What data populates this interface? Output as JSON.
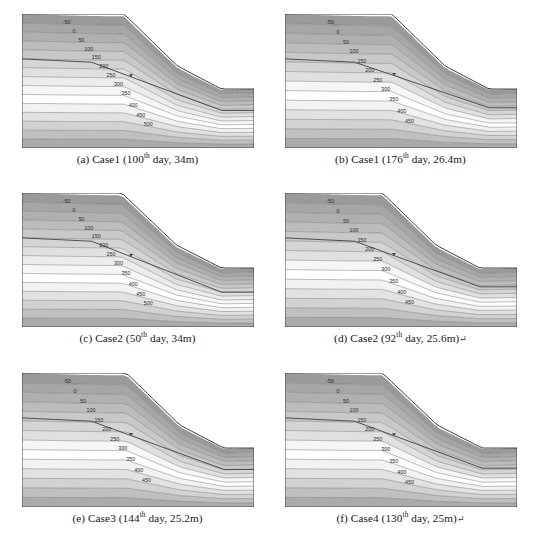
{
  "figure": {
    "title": "",
    "panel_count": 6,
    "layout": "2 columns x 3 rows",
    "background_color": "#ffffff"
  },
  "chart_data": {
    "type": "heatmap",
    "xlabel": "",
    "ylabel": "",
    "grid": false,
    "legend": "none",
    "contour_units": "kPa",
    "shading": "greyscale contour bands, dark at top and bottom, light in middle",
    "panels": [
      {
        "key": "a",
        "label": "(a)",
        "case": "Case1",
        "day": "100",
        "day_ordinal": "th",
        "depth": "34m",
        "caption_prefix": "(a) Case1 (100",
        "caption_mid": " day, 34m)",
        "caption_tail": "",
        "contour_labels": [
          -50,
          0,
          50,
          100,
          150,
          200,
          250,
          300,
          350,
          400,
          450,
          500
        ],
        "contour_min": -50,
        "contour_max": 500,
        "contour_interval": 50,
        "phreatic_marker": true,
        "crest_x_frac": 0.44,
        "toe_x_frac": 0.86,
        "water_table_end_y_frac": 0.72
      },
      {
        "key": "b",
        "label": "(b)",
        "case": "Case1",
        "day": "176",
        "day_ordinal": "th",
        "depth": "26.4m",
        "caption_prefix": "(b) Case1 (176",
        "caption_mid": " day, 26.4m)",
        "caption_tail": "",
        "contour_labels": [
          -50,
          0,
          50,
          100,
          150,
          200,
          250,
          300,
          350,
          400,
          450
        ],
        "contour_min": -50,
        "contour_max": 450,
        "contour_interval": 50,
        "phreatic_marker": true,
        "crest_x_frac": 0.46,
        "toe_x_frac": 0.88,
        "water_table_end_y_frac": 0.7
      },
      {
        "key": "c",
        "label": "(c)",
        "case": "Case2",
        "day": "50",
        "day_ordinal": "th",
        "depth": "34m",
        "caption_prefix": "(c) Case2 (50",
        "caption_mid": " day, 34m)",
        "caption_tail": "",
        "contour_labels": [
          -50,
          0,
          50,
          100,
          150,
          200,
          250,
          300,
          350,
          400,
          450,
          500
        ],
        "contour_min": -50,
        "contour_max": 500,
        "contour_interval": 50,
        "phreatic_marker": true,
        "crest_x_frac": 0.43,
        "toe_x_frac": 0.86,
        "water_table_end_y_frac": 0.74
      },
      {
        "key": "d",
        "label": "(d)",
        "case": "Case2",
        "day": "92",
        "day_ordinal": "th",
        "depth": "25.6m",
        "caption_prefix": "(d) Case2 (92",
        "caption_mid": " day, 25.6m)",
        "caption_tail": "↵",
        "contour_labels": [
          -50,
          0,
          50,
          100,
          150,
          200,
          250,
          300,
          350,
          400,
          450
        ],
        "contour_min": -50,
        "contour_max": 450,
        "contour_interval": 50,
        "phreatic_marker": true,
        "crest_x_frac": 0.42,
        "toe_x_frac": 0.84,
        "water_table_end_y_frac": 0.7
      },
      {
        "key": "e",
        "label": "(e)",
        "case": "Case3",
        "day": "144",
        "day_ordinal": "th",
        "depth": "25.2m",
        "caption_prefix": "(e) Case3 (144",
        "caption_mid": " day, 25.2m)",
        "caption_tail": "",
        "contour_labels": [
          -50,
          0,
          50,
          100,
          150,
          200,
          250,
          300,
          350,
          400,
          450
        ],
        "contour_min": -50,
        "contour_max": 450,
        "contour_interval": 50,
        "phreatic_marker": true,
        "crest_x_frac": 0.45,
        "toe_x_frac": 0.87,
        "water_table_end_y_frac": 0.72
      },
      {
        "key": "f",
        "label": "(f)",
        "case": "Case4",
        "day": "130",
        "day_ordinal": "th",
        "depth": "25m",
        "caption_prefix": "(f) Case4 (130",
        "caption_mid": " day, 25m)",
        "caption_tail": "↵",
        "contour_labels": [
          -50,
          0,
          50,
          100,
          150,
          200,
          250,
          300,
          350,
          400,
          450
        ],
        "contour_min": -50,
        "contour_max": 450,
        "contour_interval": 50,
        "phreatic_marker": true,
        "crest_x_frac": 0.42,
        "toe_x_frac": 0.85,
        "water_table_end_y_frac": 0.71
      }
    ],
    "band_colors": [
      "#9a9a9a",
      "#a6a6a6",
      "#b0b0b0",
      "#bcbcbc",
      "#c8c8c8",
      "#d4d4d4",
      "#e0e0e0",
      "#ececec",
      "#f6f6f6",
      "#ffffff",
      "#f2f2f2",
      "#e2e2e2",
      "#d2d2d2",
      "#c0c0c0",
      "#ababab",
      "#949494"
    ],
    "contour_line_color": "#6e6e6e",
    "boundary_color": "#3a3a3a"
  }
}
